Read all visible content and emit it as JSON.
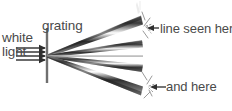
{
  "figure": {
    "labels": {
      "white": "white",
      "light": "light",
      "grating": "grating",
      "line_seen_here": "line seen here",
      "and_here": "and here"
    },
    "colors": {
      "text": "#4a4a4a",
      "beam_dark": "#2b2b2b",
      "beam_mid": "#6e6e6e",
      "beam_light": "#b4b4b4",
      "grating_line": "#707070",
      "arrow": "#333333",
      "background": "#ffffff"
    },
    "elements": {
      "grating_line": {
        "x": 47,
        "y_top": 28,
        "y_bottom": 83
      },
      "source_point": {
        "x": 47,
        "y": 56
      },
      "incoming_rays_count": 4,
      "diffracted_orders_count": 5
    },
    "incoming_rays": [
      {
        "y": 48,
        "x_start": 16,
        "x_end": 45
      },
      {
        "y": 52,
        "x_start": 16,
        "x_end": 45
      },
      {
        "y": 56,
        "x_start": 16,
        "x_end": 45
      },
      {
        "y": 60,
        "x_start": 16,
        "x_end": 45
      }
    ],
    "diffracted_beams": [
      {
        "order": "+2",
        "end_x": 143,
        "end_y": 22,
        "spread": 7,
        "style": "spectrum"
      },
      {
        "order": "+1",
        "end_x": 143,
        "end_y": 44,
        "spread": 5,
        "style": "spectrum"
      },
      {
        "order": "0",
        "end_x": 143,
        "end_y": 56,
        "spread": 1,
        "style": "thin"
      },
      {
        "order": "-1",
        "end_x": 143,
        "end_y": 68,
        "spread": 5,
        "style": "spectrum"
      },
      {
        "order": "-2",
        "end_x": 143,
        "end_y": 91,
        "spread": 7,
        "style": "spectrum"
      }
    ],
    "callouts": [
      {
        "name": "line-seen-here",
        "arrow_from_x": 158,
        "arrow_to_x": 147,
        "y": 28
      },
      {
        "name": "and-here",
        "arrow_from_x": 164,
        "arrow_to_x": 148,
        "y": 87
      }
    ]
  }
}
